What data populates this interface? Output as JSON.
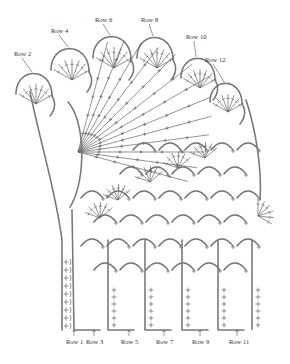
{
  "diagram": {
    "type": "crochet-chart",
    "top_labels": [
      {
        "text": "Row 2",
        "x": 14,
        "y": 56
      },
      {
        "text": "Row 4",
        "x": 51,
        "y": 33
      },
      {
        "text": "Row 6",
        "x": 95,
        "y": 22
      },
      {
        "text": "Row 8",
        "x": 141,
        "y": 22
      },
      {
        "text": "Row 10",
        "x": 186,
        "y": 39
      },
      {
        "text": "Row 12",
        "x": 205,
        "y": 62
      }
    ],
    "bottom_labels": [
      {
        "text": "Row 1",
        "x": 66,
        "y": 344
      },
      {
        "text": "Row 3",
        "x": 86,
        "y": 344
      },
      {
        "text": "Row 5",
        "x": 121,
        "y": 344
      },
      {
        "text": "Row 7",
        "x": 156,
        "y": 344
      },
      {
        "text": "Row 9",
        "x": 192,
        "y": 344
      },
      {
        "text": "Row 11",
        "x": 229,
        "y": 344
      }
    ],
    "colors": {
      "stroke": "#777777",
      "text": "#333333",
      "background": "#ffffff"
    }
  }
}
